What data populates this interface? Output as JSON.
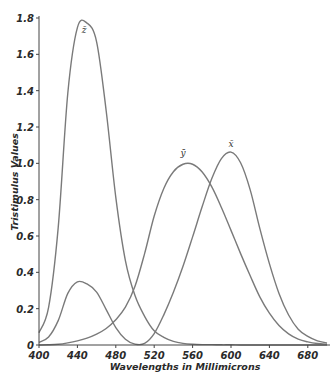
{
  "chart_data": {
    "type": "line",
    "title": "",
    "xlabel": "Wavelengths in Millimicrons",
    "ylabel": "Tristimulus Values",
    "xlim": [
      400,
      700
    ],
    "ylim": [
      0,
      1.8
    ],
    "xticks": [
      400,
      440,
      480,
      520,
      560,
      600,
      640,
      680
    ],
    "yticks": [
      0,
      0.2,
      0.4,
      0.6,
      0.8,
      1.0,
      1.2,
      1.4,
      1.6,
      1.8
    ],
    "ytick_labels": [
      "0",
      "0.2",
      "0.4",
      "0.6",
      "0.8",
      "1.0",
      "1.2",
      "1.4",
      "1.6",
      "1.8"
    ],
    "grid": false,
    "legend": "none (curves labeled inline)",
    "x": [
      400,
      410,
      420,
      430,
      440,
      450,
      460,
      470,
      480,
      490,
      500,
      510,
      520,
      530,
      540,
      550,
      560,
      570,
      580,
      590,
      600,
      610,
      620,
      630,
      640,
      650,
      660,
      670,
      680,
      690,
      700
    ],
    "series": [
      {
        "name": "z̄",
        "label_at": [
          447,
          1.72
        ],
        "values": [
          0.068,
          0.207,
          0.646,
          1.386,
          1.747,
          1.772,
          1.669,
          1.288,
          0.813,
          0.465,
          0.272,
          0.158,
          0.078,
          0.042,
          0.02,
          0.009,
          0.004,
          0.002,
          0.002,
          0.001,
          0.001,
          0.0,
          0.0,
          0.0,
          0.0,
          0.0,
          0.0,
          0.0,
          0.0,
          0.0,
          0.0
        ]
      },
      {
        "name": "ȳ",
        "label_at": [
          550,
          1.04
        ],
        "values": [
          0.0,
          0.001,
          0.004,
          0.012,
          0.023,
          0.038,
          0.06,
          0.091,
          0.139,
          0.208,
          0.323,
          0.503,
          0.71,
          0.862,
          0.954,
          0.995,
          0.995,
          0.952,
          0.87,
          0.757,
          0.631,
          0.503,
          0.381,
          0.265,
          0.175,
          0.107,
          0.061,
          0.032,
          0.017,
          0.008,
          0.004
        ]
      },
      {
        "name": "x̄",
        "label_at": [
          600,
          1.09
        ],
        "values": [
          0.014,
          0.044,
          0.134,
          0.284,
          0.348,
          0.336,
          0.291,
          0.195,
          0.096,
          0.032,
          0.005,
          0.009,
          0.063,
          0.166,
          0.29,
          0.433,
          0.595,
          0.762,
          0.916,
          1.026,
          1.062,
          1.003,
          0.854,
          0.642,
          0.448,
          0.284,
          0.165,
          0.087,
          0.047,
          0.023,
          0.011
        ]
      }
    ]
  }
}
